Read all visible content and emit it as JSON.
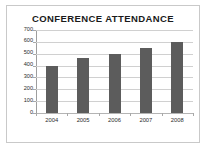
{
  "chart_data": {
    "type": "bar",
    "title": "CONFERENCE ATTENDANCE",
    "categories": [
      "2004",
      "2005",
      "2006",
      "2007",
      "2008"
    ],
    "values": [
      400,
      460,
      500,
      545,
      600
    ],
    "xlabel": "",
    "ylabel": "",
    "ylim": [
      0,
      700
    ],
    "yticks": [
      0,
      100,
      200,
      300,
      400,
      500,
      600,
      700
    ],
    "ytick_labels": [
      "0",
      "100",
      "200",
      "300",
      "400",
      "500",
      "600",
      "700"
    ],
    "grid": true,
    "legend": false,
    "legend_position": "none",
    "bar_color": "#5c5c5c",
    "gridline_color": "#d0d0d0",
    "axis_color": "#9e9e9e",
    "background_color": "#ffffff",
    "border_color": "#c9c9c9",
    "text_color": "#2b2b2b"
  }
}
